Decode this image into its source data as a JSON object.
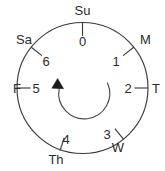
{
  "diagram": {
    "shape": "circle",
    "direction_indicator": {
      "name": "counterclockwise-arrow",
      "arrow_head": "filled-triangle",
      "arrow_position": "left"
    },
    "nodes": [
      {
        "day": "Su",
        "number": "0",
        "angle_deg": 90,
        "day_outside": true
      },
      {
        "day": "M",
        "number": "1",
        "angle_deg": 38.57,
        "day_outside": true
      },
      {
        "day": "T",
        "number": "2",
        "angle_deg": 0,
        "day_outside": true
      },
      {
        "day": "W",
        "number": "3",
        "angle_deg": -51.43,
        "day_outside": true
      },
      {
        "day": "Th",
        "number": "4",
        "angle_deg": -90,
        "day_outside": true
      },
      {
        "day": "F",
        "number": "5",
        "angle_deg": 180,
        "day_outside": true
      },
      {
        "day": "Sa",
        "number": "6",
        "angle_deg": 141.43,
        "day_outside": true
      }
    ]
  },
  "labels": {
    "su": "Su",
    "m": "M",
    "t": "T",
    "w": "W",
    "th": "Th",
    "f": "F",
    "sa": "Sa",
    "n0": "0",
    "n1": "1",
    "n2": "2",
    "n3": "3",
    "n4": "4",
    "n5": "5",
    "n6": "6"
  },
  "colors": {
    "stroke": "#3a3a3a",
    "text": "#2b2b2b",
    "arrow": "#1c1c1c",
    "background": "#ffffff"
  }
}
